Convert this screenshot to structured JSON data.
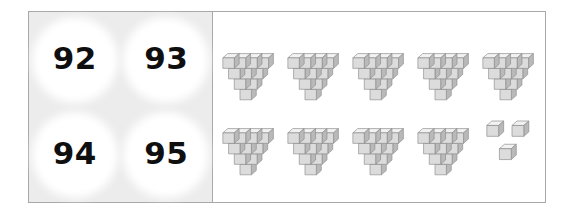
{
  "activity": {
    "title": "Base-ten block count matching",
    "instruction": ""
  },
  "choices": {
    "options": [
      {
        "id": "choice-92",
        "label": "92"
      },
      {
        "id": "choice-93",
        "label": "93"
      },
      {
        "id": "choice-94",
        "label": "94"
      },
      {
        "id": "choice-95",
        "label": "95"
      }
    ]
  },
  "blocks": {
    "cubes_per_pyramid": 10,
    "pyramid_rows": [
      4,
      3,
      2,
      1
    ],
    "rows": [
      {
        "pyramids": 5,
        "loose_cubes": 0
      },
      {
        "pyramids": 4,
        "loose_cubes": 3
      }
    ],
    "total_pyramids": 9,
    "total_loose_cubes": 3,
    "total_cubes": 93
  },
  "colors": {
    "frame_border": "#a8a8a8",
    "choice_panel_background": "#ececec",
    "choice_circle": "#ffffff",
    "choice_text": "#0f0f0f",
    "cube_top": "#f2f2f2",
    "cube_front": "#dcdcdc",
    "cube_side": "#b9b9b9",
    "cube_outline": "#8c8c8c",
    "page_background": "#ffffff"
  }
}
